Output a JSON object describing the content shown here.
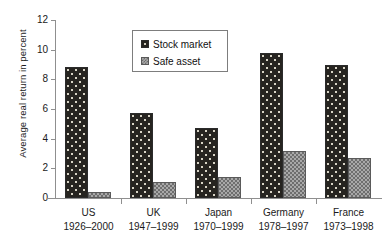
{
  "chart_data": {
    "type": "bar",
    "title": "",
    "xlabel": "",
    "ylabel": "Average real return in percent",
    "ylim": [
      0,
      12
    ],
    "yticks": [
      "0",
      "2",
      "4",
      "6",
      "8",
      "10",
      "12"
    ],
    "grid": false,
    "legend_position": "top-center",
    "categories": [
      "US",
      "UK",
      "Japan",
      "Germany",
      "France"
    ],
    "category_periods": [
      "1926–2000",
      "1947–1999",
      "1970–1999",
      "1978–1997",
      "1973–1998"
    ],
    "series": [
      {
        "name": "Stock market",
        "values": [
          8.8,
          5.7,
          4.7,
          9.8,
          9.0
        ],
        "color": "#262420"
      },
      {
        "name": "Safe asset",
        "values": [
          0.4,
          1.1,
          1.4,
          3.2,
          2.7
        ],
        "color": "#a8a8a8"
      }
    ]
  },
  "legend": {
    "items": [
      {
        "label": "Stock market"
      },
      {
        "label": "Safe asset"
      }
    ]
  },
  "axis": {
    "y_title": "Average real return in percent",
    "y_ticks": [
      "12",
      "10",
      "8",
      "6",
      "4",
      "2",
      "0"
    ]
  },
  "x_labels": [
    {
      "name": "US",
      "years": "1926–2000"
    },
    {
      "name": "UK",
      "years": "1947–1999"
    },
    {
      "name": "Japan",
      "years": "1970–1999"
    },
    {
      "name": "Germany",
      "years": "1978–1997"
    },
    {
      "name": "France",
      "years": "1973–1998"
    }
  ]
}
